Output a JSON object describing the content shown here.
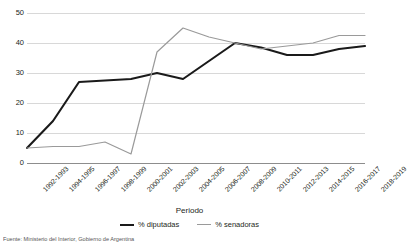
{
  "chart_data": {
    "type": "line",
    "title": "",
    "xlabel": "Periodo",
    "ylabel": "",
    "ylim": [
      0,
      50
    ],
    "ytick_step": 10,
    "yticks": [
      "0",
      "10",
      "20",
      "30",
      "40",
      "50"
    ],
    "grid": true,
    "legend_position": "bottom",
    "categories": [
      "1992-1993",
      "1994-1995",
      "1996-1997",
      "1998-1999",
      "2000-2001",
      "2002-2003",
      "2004-2005",
      "2006-2007",
      "2008-2009",
      "2010-2011",
      "2012-2013",
      "2014-2015",
      "2016-2017",
      "2018-2019"
    ],
    "series": [
      {
        "name": "% diputadas",
        "color": "#1a1a1a",
        "values": [
          5,
          14,
          27,
          27.5,
          28,
          30,
          28,
          34,
          40,
          38.5,
          36,
          36,
          38,
          39
        ]
      },
      {
        "name": "% senadoras",
        "color": "#9a9a9a",
        "values": [
          5,
          5.5,
          5.5,
          7,
          3,
          37,
          45,
          42,
          40,
          38,
          39,
          40,
          42.5,
          42.5
        ]
      }
    ]
  },
  "axis": {
    "x_title": "Periodo"
  },
  "legend": {
    "items": [
      {
        "label": "% diputadas"
      },
      {
        "label": "% senadoras"
      }
    ]
  },
  "footer": {
    "source": "Fuente: Ministerio del Interior, Gobierno de Argentina"
  }
}
